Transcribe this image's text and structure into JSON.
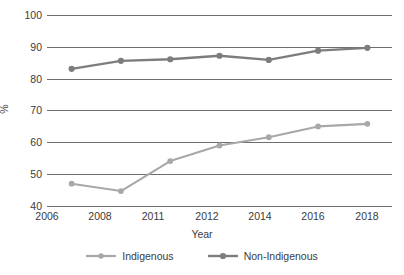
{
  "chart_data": {
    "type": "line",
    "title": "",
    "xlabel": "Year",
    "ylabel": "%",
    "categories": [
      "2006",
      "2008",
      "2011",
      "2012",
      "2014",
      "2016",
      "2018"
    ],
    "x": [
      2006,
      2008,
      2011,
      2012,
      2014,
      2016,
      2018
    ],
    "ylim": [
      40,
      100
    ],
    "yticks": [
      40,
      50,
      60,
      70,
      80,
      90,
      100
    ],
    "grid": true,
    "legend_position": "bottom",
    "series": [
      {
        "name": "Indigenous",
        "color": "#a8a8a8",
        "values": [
          47.0,
          44.7,
          54.1,
          59.0,
          61.6,
          65.0,
          65.8
        ]
      },
      {
        "name": "Non-Indigenous",
        "color": "#7d7d7d",
        "values": [
          83.1,
          85.6,
          86.1,
          87.2,
          85.9,
          88.8,
          89.7
        ]
      }
    ]
  },
  "axis": {
    "y_label": "%",
    "x_label": "Year",
    "y_tick_labels": [
      "100",
      "90",
      "80",
      "70",
      "60",
      "50",
      "40"
    ],
    "x_tick_labels": [
      "2006",
      "2008",
      "2011",
      "2012",
      "2014",
      "2016",
      "2018"
    ]
  },
  "legend": {
    "items": [
      {
        "label": "Indigenous",
        "color": "#a8a8a8"
      },
      {
        "label": "Non-Indigenous",
        "color": "#7d7d7d"
      }
    ]
  },
  "colors": {
    "grid": "#6e6e6e",
    "text": "#3b3b3b",
    "background": "#ffffff",
    "series_indigenous": "#a8a8a8",
    "series_non_indigenous": "#7d7d7d"
  }
}
